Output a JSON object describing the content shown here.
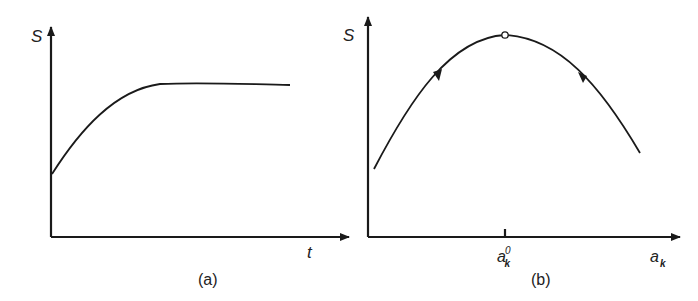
{
  "panels": [
    {
      "id": "a",
      "caption": "(a)",
      "y_axis_label": "S",
      "x_axis_label": "t",
      "description": "S rises from a non-zero initial value and saturates to a plateau over time t"
    },
    {
      "id": "b",
      "caption": "(b)",
      "y_axis_label": "S",
      "x_axis_label_base": "a",
      "x_axis_label_sub": "k",
      "tick_label_base": "a",
      "tick_label_sub": "k",
      "tick_label_sup": "0",
      "description": "S vs a_k is a concave curve with maximum at a_k^0 (open circle); arrows on both sides point toward the maximum"
    }
  ],
  "colors": {
    "line": "#1a1a1a",
    "text": "#222222",
    "background": "#ffffff"
  }
}
